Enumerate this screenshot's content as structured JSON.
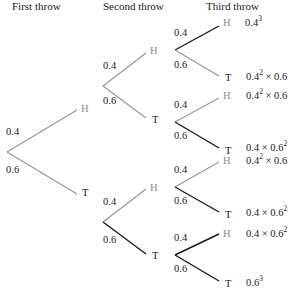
{
  "headers": {
    "first": "First throw",
    "second": "Second throw",
    "third": "Third throw"
  },
  "probabilities": {
    "heads": "0.4",
    "tails": "0.6"
  },
  "nodes": {
    "heads": "H",
    "tails": "T"
  },
  "colors": {
    "grey_line": "#9a9a9a",
    "black_line": "#1a1a1a",
    "grey_label": "#8a8a8a"
  },
  "outcomes": [
    {
      "base": "0.4",
      "exp": "3",
      "rest": ""
    },
    {
      "base": "0.4",
      "exp": "2",
      "rest": " × 0.6"
    },
    {
      "base": "0.4",
      "exp": "2",
      "rest": " × 0.6"
    },
    {
      "base": "0.4 × 0.6",
      "exp": "2",
      "rest": ""
    },
    {
      "base": "0.4",
      "exp": "2",
      "rest": " × 0.6"
    },
    {
      "base": "0.4 × 0.6",
      "exp": "2",
      "rest": ""
    },
    {
      "base": "0.4 × 0.6",
      "exp": "2",
      "rest": ""
    },
    {
      "base": "0.6",
      "exp": "3",
      "rest": ""
    }
  ]
}
